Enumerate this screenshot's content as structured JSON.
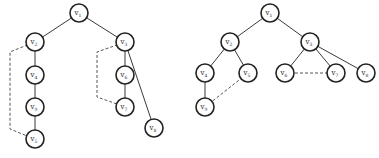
{
  "diagrams": [
    {
      "id": "left-tree",
      "nodes": [
        {
          "id": "v1",
          "label": "v",
          "sub": "1",
          "x": 79,
          "y": 13
        },
        {
          "id": "v2",
          "label": "v",
          "sub": "2",
          "x": 35,
          "y": 42
        },
        {
          "id": "v4",
          "label": "v",
          "sub": "4",
          "x": 35,
          "y": 75
        },
        {
          "id": "v9",
          "label": "v",
          "sub": "9",
          "x": 35,
          "y": 107
        },
        {
          "id": "v5",
          "label": "v",
          "sub": "5",
          "x": 35,
          "y": 139
        },
        {
          "id": "v3",
          "label": "v",
          "sub": "3",
          "x": 125,
          "y": 42
        },
        {
          "id": "v6",
          "label": "v",
          "sub": "6",
          "x": 125,
          "y": 75
        },
        {
          "id": "v7",
          "label": "v",
          "sub": "7",
          "x": 125,
          "y": 107
        },
        {
          "id": "v8",
          "label": "v",
          "sub": "8",
          "x": 154,
          "y": 128
        }
      ],
      "edges": [
        {
          "from": "v1",
          "to": "v2",
          "style": "solid"
        },
        {
          "from": "v1",
          "to": "v3",
          "style": "solid"
        },
        {
          "from": "v2",
          "to": "v4",
          "style": "solid"
        },
        {
          "from": "v4",
          "to": "v9",
          "style": "solid"
        },
        {
          "from": "v9",
          "to": "v5",
          "style": "solid"
        },
        {
          "from": "v3",
          "to": "v6",
          "style": "solid"
        },
        {
          "from": "v6",
          "to": "v7",
          "style": "solid"
        },
        {
          "from": "v3",
          "to": "v8",
          "style": "solid"
        },
        {
          "from": "v2",
          "to": "v5",
          "style": "dashed",
          "via_x": 10
        },
        {
          "from": "v3",
          "to": "v7",
          "style": "dashed",
          "via_x": 97
        }
      ]
    },
    {
      "id": "right-tree",
      "nodes": [
        {
          "id": "v1",
          "label": "v",
          "sub": "1",
          "x": 270,
          "y": 13
        },
        {
          "id": "v2",
          "label": "v",
          "sub": "2",
          "x": 230,
          "y": 42
        },
        {
          "id": "v3",
          "label": "v",
          "sub": "3",
          "x": 310,
          "y": 42
        },
        {
          "id": "v4",
          "label": "v",
          "sub": "4",
          "x": 205,
          "y": 73
        },
        {
          "id": "v5",
          "label": "v",
          "sub": "5",
          "x": 248,
          "y": 73
        },
        {
          "id": "v9",
          "label": "v",
          "sub": "9",
          "x": 205,
          "y": 107
        },
        {
          "id": "v6",
          "label": "v",
          "sub": "6",
          "x": 285,
          "y": 73
        },
        {
          "id": "v7",
          "label": "v",
          "sub": "7",
          "x": 336,
          "y": 73
        },
        {
          "id": "v8",
          "label": "v",
          "sub": "8",
          "x": 366,
          "y": 73
        }
      ],
      "edges": [
        {
          "from": "v1",
          "to": "v2",
          "style": "solid"
        },
        {
          "from": "v1",
          "to": "v3",
          "style": "solid"
        },
        {
          "from": "v2",
          "to": "v4",
          "style": "solid"
        },
        {
          "from": "v2",
          "to": "v5",
          "style": "solid"
        },
        {
          "from": "v4",
          "to": "v9",
          "style": "solid"
        },
        {
          "from": "v3",
          "to": "v6",
          "style": "solid"
        },
        {
          "from": "v3",
          "to": "v7",
          "style": "solid"
        },
        {
          "from": "v3",
          "to": "v8",
          "style": "solid"
        },
        {
          "from": "v9",
          "to": "v5",
          "style": "dashed"
        },
        {
          "from": "v6",
          "to": "v7",
          "style": "dashed"
        }
      ]
    }
  ],
  "style": {
    "node_radius": 9,
    "node_stroke": "#222222",
    "edge_color": "#3a3a3a",
    "dashed_color": "#555555",
    "background": "#ffffff"
  }
}
